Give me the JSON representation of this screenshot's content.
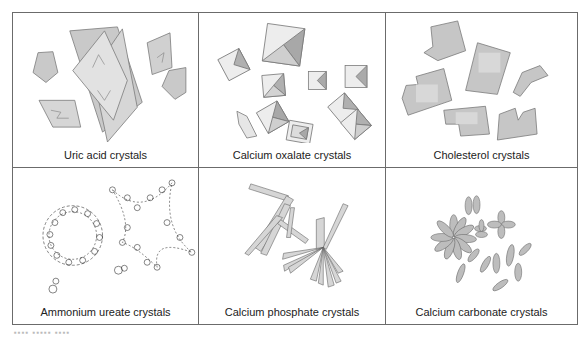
{
  "figure": {
    "panels": [
      {
        "id": "uric-acid",
        "label": "Uric acid crystals",
        "shape": "rhomboid plates and hexagons"
      },
      {
        "id": "calcium-oxalate",
        "label": "Calcium oxalate crystals",
        "shape": "envelope-shaped squares (octahedral)"
      },
      {
        "id": "cholesterol",
        "label": "Cholesterol crystals",
        "shape": "notched rectangular plates"
      },
      {
        "id": "ammonium-ureate",
        "label": "Ammonium ureate crystals",
        "shape": "spiky spheroid clusters"
      },
      {
        "id": "calcium-phosphate",
        "label": "Calcium phosphate crystals",
        "shape": "radiating prisms"
      },
      {
        "id": "calcium-carbonate",
        "label": "Calcium carbonate crystals",
        "shape": "dumbbells and spheres"
      }
    ],
    "colors": {
      "border": "#6b6b6b",
      "crystal_fill": "#c9c9c9",
      "crystal_light": "#e6e6e6",
      "crystal_stroke": "#7a7a7a"
    }
  }
}
